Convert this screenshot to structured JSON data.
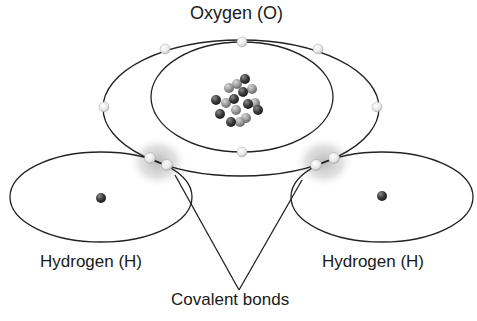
{
  "diagram": {
    "labels": {
      "oxygen": "Oxygen (O)",
      "hydrogen_left": "Hydrogen (H)",
      "hydrogen_right": "Hydrogen (H)",
      "bonds": "Covalent bonds"
    },
    "oxygen_atom": {
      "inner_shell_electrons": 2,
      "outer_shell_electrons": 6,
      "nucleus_particles": 16
    },
    "hydrogen_atoms": 2,
    "shared_electron_pairs": 2,
    "colors": {
      "line": "#222222",
      "electron": "#f0f0f0",
      "proton": "#9a9a9a",
      "neutron": "#3c3c3c",
      "bond_glow": "#bdbdbd"
    }
  }
}
